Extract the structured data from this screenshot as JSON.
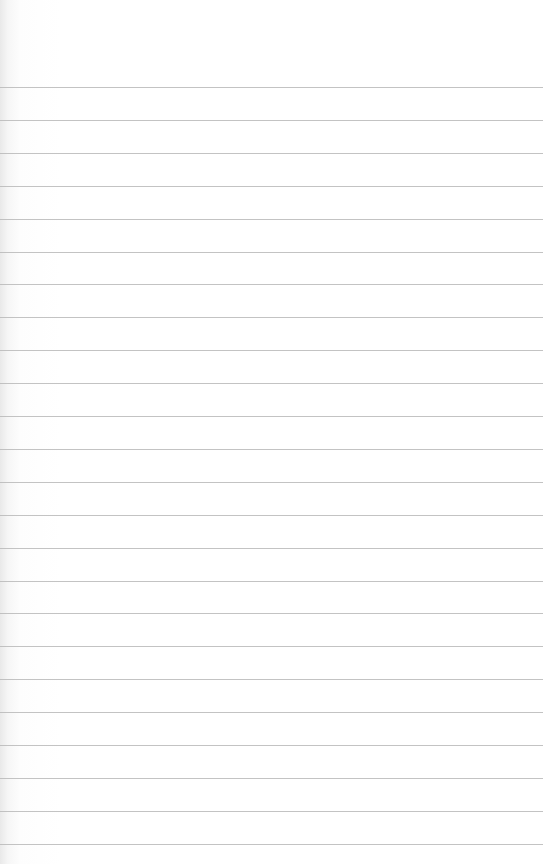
{
  "sheet": {
    "type": "lined paper",
    "background_color": "#ffffff",
    "rule_color": "#b9b9b9",
    "first_rule_y": 87,
    "rule_spacing": 32.9,
    "rule_count": 24
  }
}
